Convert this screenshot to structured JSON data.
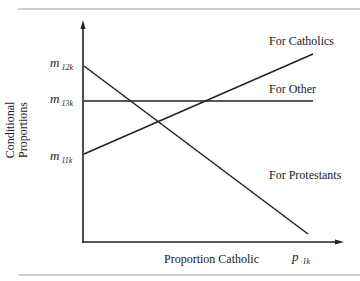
{
  "diagram": {
    "y_axis_label": [
      "Conditional",
      "Proportions"
    ],
    "x_axis_label": "Proportion Catholic",
    "x_axis_end_label": {
      "main": "p",
      "sub": "·1k"
    },
    "y_ticks": [
      {
        "main": "m",
        "sub": "12k"
      },
      {
        "main": "m",
        "sub": "13k"
      },
      {
        "main": "m",
        "sub": "11k"
      }
    ],
    "lines": [
      {
        "label": "For Catholics",
        "from": "m11k",
        "trend": "increasing"
      },
      {
        "label": "For Other",
        "from": "m13k",
        "trend": "constant"
      },
      {
        "label": "For Protestants",
        "from": "m12k",
        "trend": "decreasing"
      }
    ]
  }
}
